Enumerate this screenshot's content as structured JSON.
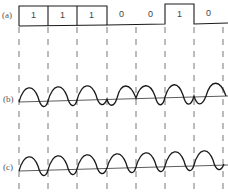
{
  "diagram": {
    "panels": [
      {
        "id": "a",
        "label": "(a)",
        "kind": "bit-sequence"
      },
      {
        "id": "b",
        "label": "(b)",
        "kind": "phase-shift-keyed-wave"
      },
      {
        "id": "c",
        "label": "(c)",
        "kind": "reference-carrier-wave"
      }
    ],
    "bits": [
      "1",
      "1",
      "1",
      "0",
      "0",
      "1",
      "0"
    ],
    "colors": {
      "line": "#1a1a1a",
      "dash": "#555555",
      "text": "#444444"
    }
  }
}
